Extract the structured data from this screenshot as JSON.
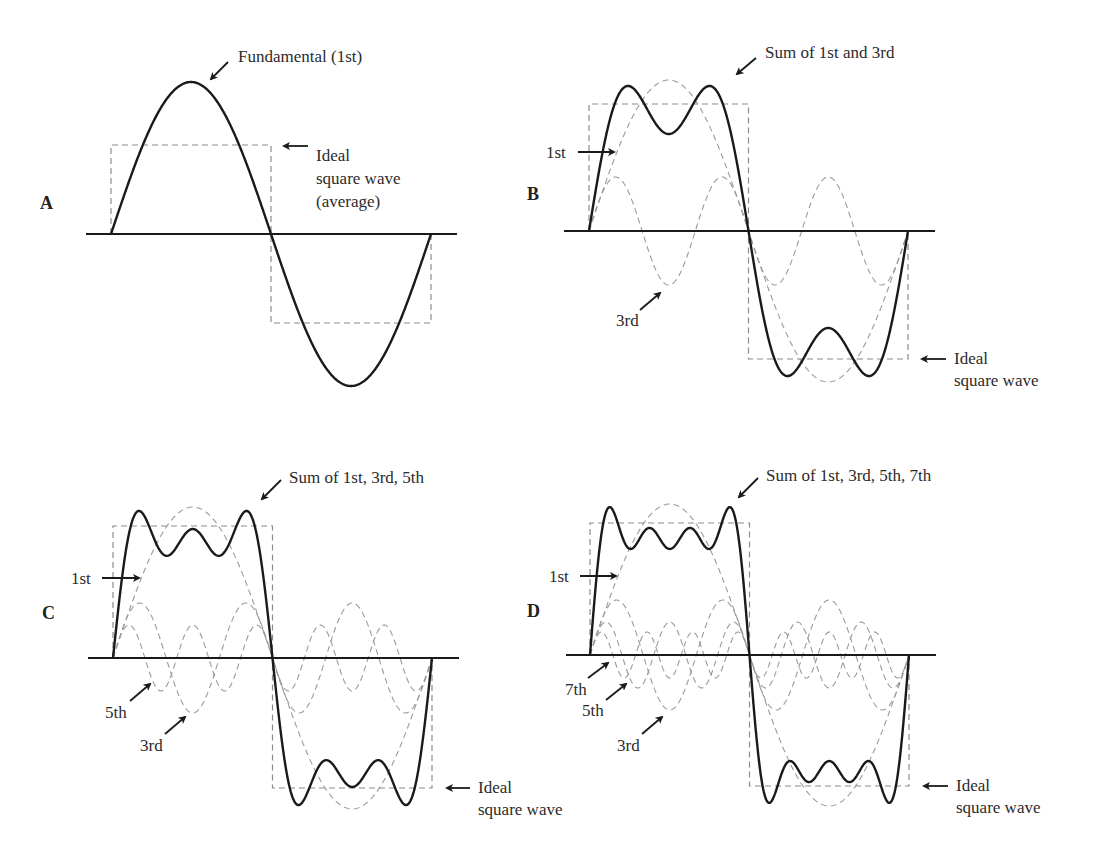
{
  "colors": {
    "sum_line": "#1a1a1a",
    "harmonic_dashed": "#9a9a9a",
    "square_dashed": "#8c8c8c",
    "axis": "#1a1a1a",
    "text": "#2b2b2b"
  },
  "panels": [
    {
      "id": "A",
      "letter": "A",
      "letter_pos": [
        40,
        193
      ],
      "axis": {
        "y": 234,
        "x_start": 86,
        "x_end": 457
      },
      "wave": {
        "x_start": 111,
        "x_end": 431
      },
      "square": {
        "top": 145,
        "bottom": 323
      },
      "harmonics": [
        {
          "order": 1,
          "amplitude": 152
        }
      ],
      "show_sum": false,
      "labels": {
        "sum": {
          "text": "Fundamental (1st)",
          "x": 238,
          "y": 46,
          "arrow": [
            228,
            62,
            211,
            79
          ]
        },
        "ideal": {
          "lines": [
            "Ideal",
            "square wave",
            "(average)"
          ],
          "x": 316,
          "y": 145,
          "arrow": [
            308,
            146,
            284,
            146
          ]
        }
      },
      "harmonic_labels": []
    },
    {
      "id": "B",
      "letter": "B",
      "letter_pos": [
        527,
        184
      ],
      "axis": {
        "y": 231,
        "x_start": 564,
        "x_end": 935
      },
      "wave": {
        "x_start": 589,
        "x_end": 908
      },
      "square": {
        "top": 104,
        "bottom": 359
      },
      "harmonics": [
        {
          "order": 1,
          "amplitude": 151
        },
        {
          "order": 3,
          "amplitude": 54
        }
      ],
      "show_sum": true,
      "labels": {
        "sum": {
          "text": "Sum of 1st and 3rd",
          "x": 765,
          "y": 42,
          "arrow": [
            756,
            58,
            737,
            74
          ]
        },
        "ideal": {
          "lines": [
            "Ideal",
            "square wave"
          ],
          "x": 954,
          "y": 348,
          "arrow": [
            946,
            359,
            922,
            359
          ]
        }
      },
      "harmonic_labels": [
        {
          "text": "1st",
          "x": 546,
          "y": 142,
          "arrow": [
            578,
            152,
            614,
            152
          ]
        },
        {
          "text": "3rd",
          "x": 616,
          "y": 310,
          "arrow": [
            640,
            310,
            660,
            293
          ]
        }
      ]
    },
    {
      "id": "C",
      "letter": "C",
      "letter_pos": [
        42,
        603
      ],
      "axis": {
        "y": 658,
        "x_start": 88,
        "x_end": 459
      },
      "wave": {
        "x_start": 113,
        "x_end": 432
      },
      "square": {
        "top": 526,
        "bottom": 788
      },
      "harmonics": [
        {
          "order": 1,
          "amplitude": 151
        },
        {
          "order": 3,
          "amplitude": 55
        },
        {
          "order": 5,
          "amplitude": 33
        }
      ],
      "show_sum": true,
      "labels": {
        "sum": {
          "text": "Sum of 1st, 3rd, 5th",
          "x": 289,
          "y": 467,
          "arrow": [
            281,
            480,
            262,
            499
          ]
        },
        "ideal": {
          "lines": [
            "Ideal",
            "square wave"
          ],
          "x": 478,
          "y": 777,
          "arrow": [
            470,
            788,
            447,
            788
          ]
        }
      },
      "harmonic_labels": [
        {
          "text": "1st",
          "x": 71,
          "y": 568,
          "arrow": [
            102,
            578,
            139,
            578
          ]
        },
        {
          "text": "5th",
          "x": 105,
          "y": 702,
          "arrow": [
            130,
            701,
            150,
            684
          ]
        },
        {
          "text": "3rd",
          "x": 140,
          "y": 735,
          "arrow": [
            165,
            734,
            185,
            717
          ]
        }
      ]
    },
    {
      "id": "D",
      "letter": "D",
      "letter_pos": [
        527,
        601
      ],
      "axis": {
        "y": 655,
        "x_start": 566,
        "x_end": 936
      },
      "wave": {
        "x_start": 590,
        "x_end": 909
      },
      "square": {
        "top": 523,
        "bottom": 786
      },
      "harmonics": [
        {
          "order": 1,
          "amplitude": 151
        },
        {
          "order": 3,
          "amplitude": 55
        },
        {
          "order": 5,
          "amplitude": 33
        },
        {
          "order": 7,
          "amplitude": 23
        }
      ],
      "show_sum": true,
      "labels": {
        "sum": {
          "text": "Sum of 1st, 3rd, 5th, 7th",
          "x": 766,
          "y": 465,
          "arrow": [
            758,
            478,
            739,
            497
          ]
        },
        "ideal": {
          "lines": [
            "Ideal",
            "square wave"
          ],
          "x": 956,
          "y": 775,
          "arrow": [
            948,
            786,
            924,
            786
          ]
        }
      },
      "harmonic_labels": [
        {
          "text": "1st",
          "x": 549,
          "y": 566,
          "arrow": [
            580,
            576,
            616,
            576
          ]
        },
        {
          "text": "7th",
          "x": 565,
          "y": 679,
          "arrow": [
            588,
            678,
            608,
            663
          ]
        },
        {
          "text": "5th",
          "x": 582,
          "y": 700,
          "arrow": [
            606,
            700,
            626,
            684
          ]
        },
        {
          "text": "3rd",
          "x": 617,
          "y": 735,
          "arrow": [
            642,
            734,
            662,
            717
          ]
        }
      ]
    }
  ],
  "chart_data": [
    {
      "type": "line",
      "title": "A",
      "series": [
        {
          "name": "Fundamental (1st)",
          "harmonic": 1,
          "relative_amplitude": 1.0
        }
      ],
      "reference": "Ideal square wave (average)"
    },
    {
      "type": "line",
      "title": "B",
      "series": [
        {
          "name": "1st",
          "harmonic": 1,
          "relative_amplitude": 1.0
        },
        {
          "name": "3rd",
          "harmonic": 3,
          "relative_amplitude": 0.36
        },
        {
          "name": "Sum of 1st and 3rd"
        }
      ],
      "reference": "Ideal square wave"
    },
    {
      "type": "line",
      "title": "C",
      "series": [
        {
          "name": "1st",
          "harmonic": 1,
          "relative_amplitude": 1.0
        },
        {
          "name": "3rd",
          "harmonic": 3,
          "relative_amplitude": 0.36
        },
        {
          "name": "5th",
          "harmonic": 5,
          "relative_amplitude": 0.22
        },
        {
          "name": "Sum of 1st, 3rd, 5th"
        }
      ],
      "reference": "Ideal square wave"
    },
    {
      "type": "line",
      "title": "D",
      "series": [
        {
          "name": "1st",
          "harmonic": 1,
          "relative_amplitude": 1.0
        },
        {
          "name": "3rd",
          "harmonic": 3,
          "relative_amplitude": 0.36
        },
        {
          "name": "5th",
          "harmonic": 5,
          "relative_amplitude": 0.22
        },
        {
          "name": "7th",
          "harmonic": 7,
          "relative_amplitude": 0.15
        },
        {
          "name": "Sum of 1st, 3rd, 5th, 7th"
        }
      ],
      "reference": "Ideal square wave"
    }
  ]
}
